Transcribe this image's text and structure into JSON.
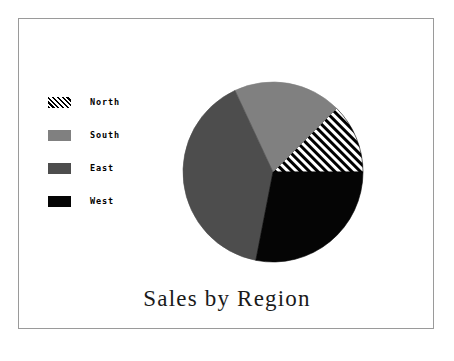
{
  "figure": {
    "background_color": "#ffffff",
    "frame_color": "#9a9a9a"
  },
  "chart_data": {
    "type": "pie",
    "title": "Sales by Region",
    "xlabel": "",
    "ylabel": "",
    "categories": [
      "North",
      "South",
      "East",
      "West"
    ],
    "values": [
      12.5,
      19.5,
      40.0,
      28.0
    ],
    "units": "percent",
    "start_angle_deg": 0,
    "direction": "counterclockwise",
    "legend_position": "left",
    "grid": false,
    "slices": [
      {
        "label": "North",
        "value": 12.5,
        "start_angle_deg": 0,
        "end_angle_deg": 45,
        "fill_style": "diagonal-hatch",
        "color": "#000000",
        "background": "#ffffff"
      },
      {
        "label": "South",
        "value": 19.5,
        "start_angle_deg": 45,
        "end_angle_deg": 115,
        "fill_style": "solid",
        "color": "#808080",
        "background": "#808080"
      },
      {
        "label": "East",
        "value": 40.0,
        "start_angle_deg": 115,
        "end_angle_deg": 259,
        "fill_style": "solid",
        "color": "#4d4d4d",
        "background": "#4d4d4d"
      },
      {
        "label": "West",
        "value": 28.0,
        "start_angle_deg": 259,
        "end_angle_deg": 360,
        "fill_style": "solid",
        "color": "#050505",
        "background": "#050505"
      }
    ],
    "geometry": {
      "center_x": 273,
      "center_y": 172,
      "radius": 90
    }
  },
  "legend": {
    "items": [
      {
        "label": "North",
        "swatch_name": "legend-swatch-north",
        "fill_style": "diagonal-hatch",
        "color": "#000000"
      },
      {
        "label": "South",
        "swatch_name": "legend-swatch-south",
        "fill_style": "solid",
        "color": "#808080"
      },
      {
        "label": "East",
        "swatch_name": "legend-swatch-east",
        "fill_style": "solid",
        "color": "#4d4d4d"
      },
      {
        "label": "West",
        "swatch_name": "legend-swatch-west",
        "fill_style": "solid",
        "color": "#050505"
      }
    ]
  }
}
